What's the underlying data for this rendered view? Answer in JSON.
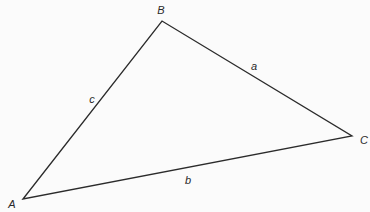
{
  "diagram": {
    "type": "triangle",
    "stroke_color": "#2b2b2b",
    "background": "#fbfbfb",
    "vertices": [
      {
        "label": "A",
        "x": 23,
        "y": 199,
        "label_x": 12,
        "label_y": 204
      },
      {
        "label": "B",
        "x": 162,
        "y": 21,
        "label_x": 161,
        "label_y": 10
      },
      {
        "label": "C",
        "x": 352,
        "y": 136,
        "label_x": 364,
        "label_y": 140
      }
    ],
    "sides": [
      {
        "label": "a",
        "from": "B",
        "to": "C",
        "label_x": 254,
        "label_y": 66
      },
      {
        "label": "b",
        "from": "A",
        "to": "C",
        "label_x": 188,
        "label_y": 180
      },
      {
        "label": "c",
        "from": "A",
        "to": "B",
        "label_x": 92,
        "label_y": 99
      }
    ]
  }
}
